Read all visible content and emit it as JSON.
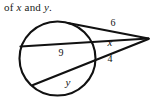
{
  "caption": {
    "prefix": "of ",
    "var1": "x",
    "conjunction": " and ",
    "var2": "y",
    "suffix": "."
  },
  "figure": {
    "name": "circle-two-secants-diagram",
    "labels": {
      "outer_upper_segment": "6",
      "inner_upper_segment": "x",
      "outer_lower_segment": "4",
      "chord_upper": "9",
      "chord_lower": "y"
    },
    "colors": {
      "stroke": "#111111",
      "background": "#ffffff",
      "text": "#111111"
    }
  }
}
